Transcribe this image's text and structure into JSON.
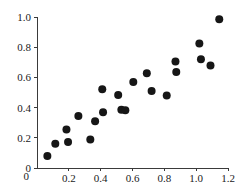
{
  "chart_data": {
    "type": "scatter",
    "title": "",
    "subtitle": "",
    "xlabel": "",
    "ylabel": "",
    "xlim": [
      0,
      1.2
    ],
    "ylim": [
      0,
      1.0
    ],
    "xticks": [
      0,
      0.2,
      0.4,
      0.6,
      0.8,
      1.0,
      1.2
    ],
    "xticklabels": [
      "0",
      "0.2",
      "0.4",
      "0.6",
      "0.8",
      "1.0",
      "1.2"
    ],
    "yticks": [
      0,
      0.2,
      0.4,
      0.6,
      0.8,
      1.0
    ],
    "yticklabels": [
      "0",
      "0.2",
      "0.4",
      "0.6",
      "0.8",
      "1.0"
    ],
    "grid": false,
    "legend": false,
    "legend_position": "none",
    "marker": "filled-circle",
    "marker_color": "#161616",
    "marker_size": 4,
    "axis_color": "#3a3a3a",
    "background_color": "#ffffff",
    "n_points": 22,
    "x": [
      0.065,
      0.115,
      0.185,
      0.195,
      0.26,
      0.335,
      0.365,
      0.41,
      0.415,
      0.51,
      0.53,
      0.555,
      0.605,
      0.69,
      0.72,
      0.815,
      0.87,
      0.875,
      1.02,
      1.03,
      1.09,
      1.145
    ],
    "y": [
      0.08,
      0.16,
      0.255,
      0.172,
      0.345,
      0.188,
      0.31,
      0.522,
      0.37,
      0.483,
      0.385,
      0.382,
      0.57,
      0.628,
      0.51,
      0.48,
      0.705,
      0.635,
      0.825,
      0.72,
      0.678,
      0.985
    ],
    "points": [
      {
        "x": 0.065,
        "y": 0.08
      },
      {
        "x": 0.115,
        "y": 0.16
      },
      {
        "x": 0.185,
        "y": 0.255
      },
      {
        "x": 0.195,
        "y": 0.172
      },
      {
        "x": 0.26,
        "y": 0.345
      },
      {
        "x": 0.335,
        "y": 0.188
      },
      {
        "x": 0.365,
        "y": 0.31
      },
      {
        "x": 0.41,
        "y": 0.522
      },
      {
        "x": 0.415,
        "y": 0.37
      },
      {
        "x": 0.51,
        "y": 0.483
      },
      {
        "x": 0.53,
        "y": 0.385
      },
      {
        "x": 0.555,
        "y": 0.382
      },
      {
        "x": 0.605,
        "y": 0.57
      },
      {
        "x": 0.69,
        "y": 0.628
      },
      {
        "x": 0.72,
        "y": 0.51
      },
      {
        "x": 0.815,
        "y": 0.48
      },
      {
        "x": 0.87,
        "y": 0.705
      },
      {
        "x": 0.875,
        "y": 0.635
      },
      {
        "x": 1.02,
        "y": 0.825
      },
      {
        "x": 1.03,
        "y": 0.72
      },
      {
        "x": 1.09,
        "y": 0.678
      },
      {
        "x": 1.145,
        "y": 0.985
      }
    ]
  },
  "layout": {
    "plot_left": 37,
    "plot_right": 228,
    "plot_top": 17,
    "plot_bottom": 168
  }
}
